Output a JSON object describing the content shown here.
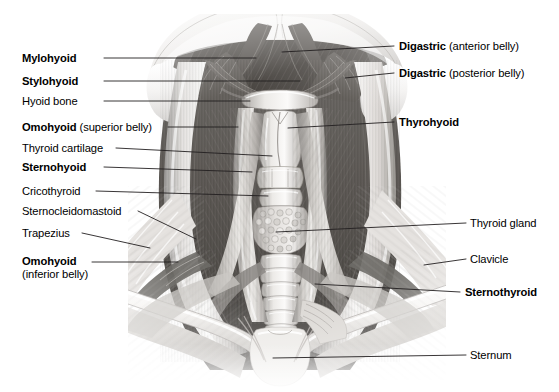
{
  "figure": {
    "background_color": "#ffffff",
    "line_color": "#231f20",
    "text_color": "#000000",
    "width": 559,
    "height": 392
  },
  "labels_left": [
    {
      "id": "mylohyoid",
      "bold": "Mylohyoid",
      "plain": "",
      "sub": "",
      "text_x": 22,
      "text_y": 52,
      "leader": [
        [
          104,
          58
        ],
        [
          256,
          58
        ]
      ]
    },
    {
      "id": "stylohyoid",
      "bold": "Stylohyoid",
      "plain": "",
      "sub": "",
      "text_x": 22,
      "text_y": 75,
      "leader": [
        [
          104,
          81
        ],
        [
          300,
          81
        ]
      ]
    },
    {
      "id": "hyoid-bone",
      "bold": "",
      "plain": "Hyoid bone",
      "sub": "",
      "text_x": 22,
      "text_y": 95,
      "leader": [
        [
          104,
          101
        ],
        [
          250,
          101
        ]
      ]
    },
    {
      "id": "omohyoid-superior",
      "bold": "Omohyoid",
      "plain": " (superior belly)",
      "sub": "",
      "text_x": 22,
      "text_y": 121,
      "leader": [
        [
          168,
          127
        ],
        [
          238,
          127
        ]
      ]
    },
    {
      "id": "thyroid-cartilage",
      "bold": "",
      "plain": "Thyroid cartilage",
      "sub": "",
      "text_x": 22,
      "text_y": 142,
      "leader": [
        [
          116,
          148
        ],
        [
          272,
          156
        ]
      ]
    },
    {
      "id": "sternohyoid",
      "bold": "Sternohyoid",
      "plain": "",
      "sub": "",
      "text_x": 22,
      "text_y": 161,
      "leader": [
        [
          104,
          167
        ],
        [
          252,
          172
        ]
      ]
    },
    {
      "id": "cricothyroid",
      "bold": "",
      "plain": "Cricothyroid",
      "sub": "",
      "text_x": 22,
      "text_y": 185,
      "leader": [
        [
          96,
          191
        ],
        [
          268,
          196
        ]
      ]
    },
    {
      "id": "sternocleidomastoid",
      "bold": "",
      "plain": "Sternocleidomastoid",
      "sub": "",
      "text_x": 22,
      "text_y": 205,
      "leader": [
        [
          138,
          211
        ],
        [
          196,
          239
        ]
      ]
    },
    {
      "id": "trapezius",
      "bold": "",
      "plain": "Trapezius",
      "sub": "",
      "text_x": 22,
      "text_y": 227,
      "leader": [
        [
          82,
          233
        ],
        [
          150,
          248
        ]
      ]
    },
    {
      "id": "omohyoid-inferior",
      "bold": "Omohyoid",
      "sub": "(inferior belly)",
      "plain": "",
      "text_x": 22,
      "text_y": 255,
      "leader": [
        [
          92,
          262
        ],
        [
          178,
          262
        ]
      ]
    }
  ],
  "labels_right": [
    {
      "id": "digastric-anterior",
      "bold": "Digastric",
      "plain": " (anterior belly)",
      "sub": "",
      "text_x": 399,
      "text_y": 40,
      "leader": [
        [
          394,
          46
        ],
        [
          282,
          52
        ]
      ]
    },
    {
      "id": "digastric-posterior",
      "bold": "Digastric",
      "plain": " (posterior belly)",
      "sub": "",
      "text_x": 399,
      "text_y": 67,
      "leader": [
        [
          394,
          73
        ],
        [
          345,
          78
        ]
      ]
    },
    {
      "id": "thyrohyoid",
      "bold": "Thyrohyoid",
      "plain": "",
      "sub": "",
      "text_x": 399,
      "text_y": 116,
      "leader": [
        [
          394,
          122
        ],
        [
          288,
          128
        ]
      ]
    },
    {
      "id": "thyroid-gland",
      "bold": "",
      "plain": "Thyroid gland",
      "sub": "",
      "text_x": 470,
      "text_y": 217,
      "leader": [
        [
          466,
          223
        ],
        [
          276,
          232
        ]
      ]
    },
    {
      "id": "clavicle",
      "bold": "",
      "plain": "Clavicle",
      "sub": "",
      "text_x": 470,
      "text_y": 253,
      "leader": [
        [
          466,
          259
        ],
        [
          424,
          265
        ]
      ]
    },
    {
      "id": "sternothyroid",
      "bold": "Sternothyroid",
      "plain": "",
      "sub": "",
      "text_x": 465,
      "text_y": 286,
      "leader": [
        [
          460,
          292
        ],
        [
          315,
          284
        ]
      ]
    },
    {
      "id": "sternum",
      "bold": "",
      "plain": "Sternum",
      "sub": "",
      "text_x": 470,
      "text_y": 349,
      "leader": [
        [
          466,
          355
        ],
        [
          273,
          358
        ]
      ]
    }
  ]
}
